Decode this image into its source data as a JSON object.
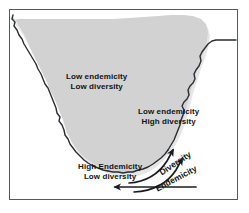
{
  "figure": {
    "type": "annotated-map-diagram",
    "region": "southern Africa",
    "width": 249,
    "height": 213
  },
  "colors": {
    "land_fill": "#d2d2d2",
    "land_shadow": "#e6e6e6",
    "coastline": "#2b2d30",
    "frame_border": "#55585c",
    "background": "#ffffff",
    "text": "#111316",
    "arrow": "#1a1c1f"
  },
  "labels": {
    "interior_north": {
      "line1": "Low endemicity",
      "line2": "Low diversity"
    },
    "east_coast": {
      "line1": "Low endemicity",
      "line2": "High diversity"
    },
    "south_tip": {
      "line1": "High  Endemicity",
      "line2": "Low  diversity"
    }
  },
  "gradient_arrows": [
    {
      "label": "Diversity",
      "direction": "increasing-northeast",
      "rotation_deg": -33
    },
    {
      "label": "Endemicity",
      "direction": "increasing-northeast",
      "rotation_deg": -28
    }
  ],
  "base_arrow": {
    "name": "southwest-trend-arrow",
    "direction": "left"
  }
}
